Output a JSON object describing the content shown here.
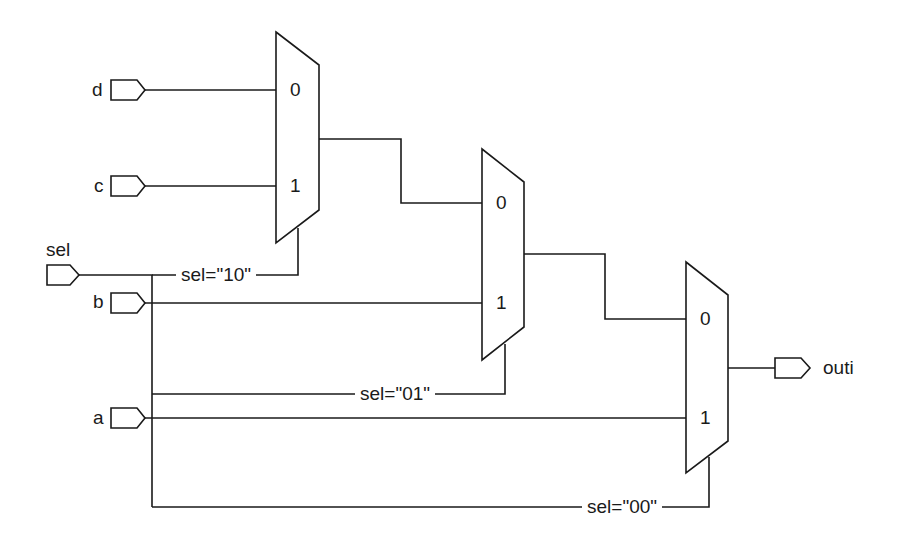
{
  "diagram": {
    "type": "multiplexer-chain",
    "stroke_color": "#1a1a1a",
    "background": "#ffffff",
    "inputs": [
      {
        "id": "d",
        "label": "d"
      },
      {
        "id": "c",
        "label": "c"
      },
      {
        "id": "sel",
        "label": "sel"
      },
      {
        "id": "b",
        "label": "b"
      },
      {
        "id": "a",
        "label": "a"
      }
    ],
    "outputs": [
      {
        "id": "outi",
        "label": "outi"
      }
    ],
    "muxes": [
      {
        "id": "mux1",
        "in0": "0",
        "in1": "1",
        "select_label": "sel=\"10\""
      },
      {
        "id": "mux2",
        "in0": "0",
        "in1": "1",
        "select_label": "sel=\"01\""
      },
      {
        "id": "mux3",
        "in0": "0",
        "in1": "1",
        "select_label": "sel=\"00\""
      }
    ]
  }
}
